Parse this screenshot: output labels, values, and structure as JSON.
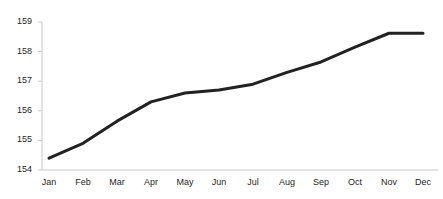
{
  "chart_data": {
    "type": "line",
    "title": "",
    "subtitle": "",
    "xlabel": "",
    "ylabel": "",
    "categories": [
      "Jan",
      "Feb",
      "Mar",
      "Apr",
      "May",
      "Jun",
      "Jul",
      "Aug",
      "Sep",
      "Oct",
      "Nov",
      "Dec"
    ],
    "values": [
      154.4,
      154.9,
      155.65,
      156.3,
      156.6,
      156.7,
      156.9,
      157.3,
      157.65,
      158.15,
      158.62,
      158.62
    ],
    "series": [
      {
        "name": "",
        "values": [
          154.4,
          154.9,
          155.65,
          156.3,
          156.6,
          156.7,
          156.9,
          157.3,
          157.65,
          158.15,
          158.62,
          158.62
        ]
      }
    ],
    "ylim": [
      154,
      159
    ],
    "xlim": [
      0,
      11
    ],
    "y_ticks": [
      154,
      155,
      156,
      157,
      158,
      159
    ],
    "y_tick_labels": [
      "154",
      "155",
      "156",
      "157",
      "158",
      "159"
    ],
    "x_tick_labels": [
      "Jan",
      "Feb",
      "Mar",
      "Apr",
      "May",
      "Jun",
      "Jul",
      "Aug",
      "Sep",
      "Oct",
      "Nov",
      "Dec"
    ],
    "grid": false,
    "legend": false,
    "legend_position": "none",
    "annotations": [],
    "line_color": "#222222",
    "line_width": 3,
    "axis_color": "#c8c8c8",
    "tick_label_color": "#262626",
    "background_color": "#ffffff"
  },
  "axes": {
    "y_labels": [
      {
        "text": "159",
        "value": 159
      },
      {
        "text": "158",
        "value": 158
      },
      {
        "text": "157",
        "value": 157
      },
      {
        "text": "156",
        "value": 156
      },
      {
        "text": "155",
        "value": 155
      },
      {
        "text": "154",
        "value": 154
      }
    ],
    "x_labels": [
      {
        "text": "Jan"
      },
      {
        "text": "Feb"
      },
      {
        "text": "Mar"
      },
      {
        "text": "Apr"
      },
      {
        "text": "May"
      },
      {
        "text": "Jun"
      },
      {
        "text": "Jul"
      },
      {
        "text": "Aug"
      },
      {
        "text": "Sep"
      },
      {
        "text": "Oct"
      },
      {
        "text": "Nov"
      },
      {
        "text": "Dec"
      }
    ]
  }
}
